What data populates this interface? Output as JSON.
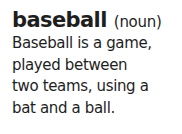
{
  "entry": {
    "term": "baseball",
    "part_of_speech": "(noun)",
    "definition_lines": [
      "Baseball is a game,",
      "played between",
      "two teams, using a",
      "bat and a ball."
    ]
  }
}
